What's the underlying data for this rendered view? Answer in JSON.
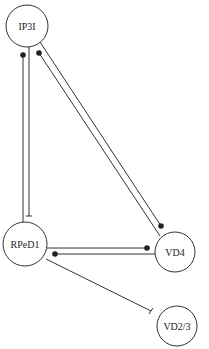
{
  "diagram": {
    "type": "neural-circuit",
    "nodes": [
      {
        "id": "IP3I",
        "label": "IP3I"
      },
      {
        "id": "RPeD1",
        "label": "RPeD1"
      },
      {
        "id": "VD4",
        "label": "VD4"
      },
      {
        "id": "VD2/3",
        "label": "VD2/3"
      }
    ],
    "edges": [
      {
        "from": "RPeD1",
        "to": "IP3I",
        "type": "excitatory",
        "terminal": "dot"
      },
      {
        "from": "IP3I",
        "to": "RPeD1",
        "type": "inhibitory",
        "terminal": "bar"
      },
      {
        "from": "VD4",
        "to": "IP3I",
        "type": "excitatory",
        "terminal": "dot"
      },
      {
        "from": "IP3I",
        "to": "VD4",
        "type": "excitatory",
        "terminal": "dot"
      },
      {
        "from": "RPeD1",
        "to": "VD4",
        "type": "excitatory",
        "terminal": "dot"
      },
      {
        "from": "VD4",
        "to": "RPeD1",
        "type": "excitatory",
        "terminal": "dot"
      },
      {
        "from": "RPeD1",
        "to": "VD2/3",
        "type": "inhibitory",
        "terminal": "bar"
      }
    ]
  }
}
